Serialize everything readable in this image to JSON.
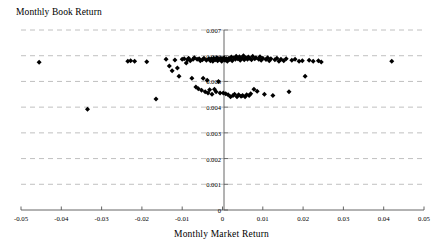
{
  "chart_data": {
    "type": "scatter",
    "title": "Monthly Book Return",
    "xlabel": "Monthly Market Return",
    "ylabel": "Monthly Book Return",
    "xlim": [
      -0.05,
      0.05
    ],
    "ylim": [
      0,
      0.007
    ],
    "grid": true,
    "grid_axis": "y",
    "legend": "none",
    "marker": "diamond",
    "marker_color": "#000000",
    "xticks": [
      -0.05,
      -0.04,
      -0.03,
      -0.02,
      -0.01,
      0,
      0.01,
      0.02,
      0.03,
      0.04,
      0.05
    ],
    "xtick_labels": [
      "-0.05",
      "-0.04",
      "-0.03",
      "-0.02",
      "-0.01",
      "0",
      "0.01",
      "0.02",
      "0.03",
      "0.04",
      "0.05"
    ],
    "yticks": [
      0,
      0.001,
      0.002,
      0.003,
      0.004,
      0.005,
      0.006,
      0.007
    ],
    "ytick_labels": [
      "0",
      "0.001",
      "0.002",
      "0.003",
      "0.004",
      "0.005",
      "0.006",
      "0.007"
    ],
    "points": [
      [
        -0.0455,
        0.00575
      ],
      [
        -0.0335,
        0.00392
      ],
      [
        -0.0235,
        0.00578
      ],
      [
        -0.0228,
        0.0058
      ],
      [
        -0.0218,
        0.00578
      ],
      [
        -0.0188,
        0.00577
      ],
      [
        -0.0165,
        0.00432
      ],
      [
        -0.014,
        0.00586
      ],
      [
        -0.0132,
        0.0056
      ],
      [
        -0.0125,
        0.00542
      ],
      [
        -0.0118,
        0.00583
      ],
      [
        -0.0112,
        0.00552
      ],
      [
        -0.0108,
        0.0052
      ],
      [
        -0.01,
        0.00586
      ],
      [
        -0.0095,
        0.00588
      ],
      [
        -0.009,
        0.00572
      ],
      [
        -0.0087,
        0.00584
      ],
      [
        -0.0084,
        0.0059
      ],
      [
        -0.008,
        0.0058
      ],
      [
        -0.0076,
        0.00512
      ],
      [
        -0.0073,
        0.00586
      ],
      [
        -0.007,
        0.00592
      ],
      [
        -0.0066,
        0.00478
      ],
      [
        -0.0063,
        0.00586
      ],
      [
        -0.006,
        0.00472
      ],
      [
        -0.0058,
        0.00588
      ],
      [
        -0.0055,
        0.0058
      ],
      [
        -0.0052,
        0.00466
      ],
      [
        -0.005,
        0.00584
      ],
      [
        -0.0048,
        0.00512
      ],
      [
        -0.0046,
        0.0059
      ],
      [
        -0.0043,
        0.0046
      ],
      [
        -0.004,
        0.00582
      ],
      [
        -0.0038,
        0.00505
      ],
      [
        -0.0036,
        0.00455
      ],
      [
        -0.0034,
        0.00588
      ],
      [
        -0.0032,
        0.00468
      ],
      [
        -0.003,
        0.0058
      ],
      [
        -0.0028,
        0.00588
      ],
      [
        -0.0026,
        0.0045
      ],
      [
        -0.0024,
        0.00578
      ],
      [
        -0.0022,
        0.0059
      ],
      [
        -0.002,
        0.0047
      ],
      [
        -0.0018,
        0.00584
      ],
      [
        -0.0016,
        0.0046
      ],
      [
        -0.0014,
        0.00592
      ],
      [
        -0.0012,
        0.0058
      ],
      [
        -0.001,
        0.005
      ],
      [
        -0.0008,
        0.00586
      ],
      [
        -0.0006,
        0.00455
      ],
      [
        -0.0004,
        0.0059
      ],
      [
        -0.0002,
        0.00578
      ],
      [
        0.0,
        0.00588
      ],
      [
        0.0002,
        0.00455
      ],
      [
        0.0004,
        0.00592
      ],
      [
        0.0006,
        0.00582
      ],
      [
        0.0008,
        0.00452
      ],
      [
        0.001,
        0.00588
      ],
      [
        0.0012,
        0.00578
      ],
      [
        0.0014,
        0.00448
      ],
      [
        0.0016,
        0.0059
      ],
      [
        0.0018,
        0.00585
      ],
      [
        0.002,
        0.0044
      ],
      [
        0.0022,
        0.00595
      ],
      [
        0.0024,
        0.0058
      ],
      [
        0.0026,
        0.00445
      ],
      [
        0.0028,
        0.00592
      ],
      [
        0.003,
        0.0045
      ],
      [
        0.0032,
        0.00586
      ],
      [
        0.0034,
        0.00598
      ],
      [
        0.0036,
        0.0044
      ],
      [
        0.0038,
        0.00588
      ],
      [
        0.004,
        0.00448
      ],
      [
        0.0042,
        0.00596
      ],
      [
        0.0044,
        0.00582
      ],
      [
        0.0046,
        0.00442
      ],
      [
        0.0048,
        0.0059
      ],
      [
        0.005,
        0.00445
      ],
      [
        0.0052,
        0.006
      ],
      [
        0.0054,
        0.00584
      ],
      [
        0.0056,
        0.0044
      ],
      [
        0.0058,
        0.00592
      ],
      [
        0.006,
        0.00448
      ],
      [
        0.0062,
        0.00586
      ],
      [
        0.0064,
        0.00595
      ],
      [
        0.0066,
        0.00445
      ],
      [
        0.0068,
        0.0059
      ],
      [
        0.007,
        0.00452
      ],
      [
        0.0072,
        0.00584
      ],
      [
        0.0075,
        0.00598
      ],
      [
        0.0078,
        0.0047
      ],
      [
        0.008,
        0.00588
      ],
      [
        0.0083,
        0.00592
      ],
      [
        0.0086,
        0.00462
      ],
      [
        0.009,
        0.00586
      ],
      [
        0.0093,
        0.00596
      ],
      [
        0.0096,
        0.00582
      ],
      [
        0.01,
        0.0059
      ],
      [
        0.0104,
        0.0045
      ],
      [
        0.0108,
        0.00585
      ],
      [
        0.0112,
        0.00592
      ],
      [
        0.0116,
        0.0058
      ],
      [
        0.012,
        0.00588
      ],
      [
        0.0125,
        0.00445
      ],
      [
        0.013,
        0.00584
      ],
      [
        0.0135,
        0.0059
      ],
      [
        0.014,
        0.00578
      ],
      [
        0.0145,
        0.00586
      ],
      [
        0.0152,
        0.0058
      ],
      [
        0.0158,
        0.00588
      ],
      [
        0.0165,
        0.0046
      ],
      [
        0.0172,
        0.00582
      ],
      [
        0.018,
        0.00586
      ],
      [
        0.019,
        0.00578
      ],
      [
        0.0198,
        0.0058
      ],
      [
        0.0205,
        0.0052
      ],
      [
        0.0215,
        0.00582
      ],
      [
        0.0225,
        0.00578
      ],
      [
        0.0238,
        0.0058
      ],
      [
        0.0245,
        0.00576
      ],
      [
        0.042,
        0.00578
      ]
    ]
  }
}
